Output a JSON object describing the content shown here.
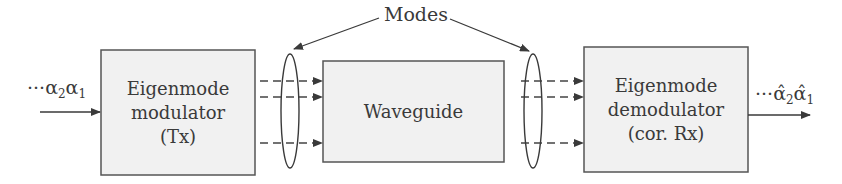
{
  "diagram": {
    "title_label": "Modes",
    "blocks": [
      {
        "id": "tx",
        "lines": [
          "Eigenmode",
          "modulator",
          "(Tx)"
        ]
      },
      {
        "id": "waveguide",
        "lines": [
          "Waveguide"
        ]
      },
      {
        "id": "rx",
        "lines": [
          "Eigenmode",
          "demodulator",
          "(cor. Rx)"
        ]
      }
    ],
    "input_symbol": {
      "prefix": "···",
      "a2": "α",
      "a2_sub": "2",
      "a1": "α",
      "a1_sub": "1"
    },
    "output_symbol": {
      "prefix": "···",
      "a2": "α̂",
      "a2_sub": "2",
      "a1": "α̂",
      "a1_sub": "1"
    },
    "colors": {
      "box_fill": "#f1f1f1",
      "stroke": "#444444",
      "text": "#3a3a3a"
    },
    "mode_lines_count": 3
  }
}
